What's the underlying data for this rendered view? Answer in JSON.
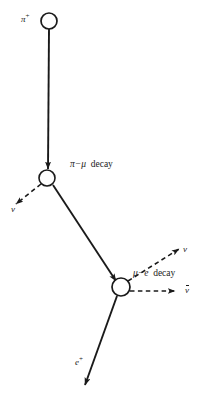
{
  "figure": {
    "background_color": "#ffffff",
    "stroke_color": "#1a1a1a",
    "width": 203,
    "height": 395
  },
  "labels": {
    "pi_plus": "π",
    "pi_plus_charge": "+",
    "neutrino_from_pion": "ν",
    "pi_mu_decay_left": "π−μ",
    "pi_mu_decay_word": "decay",
    "neutrino_from_muon": "ν",
    "mu_e_decay_left": "μ−e",
    "mu_e_decay_word": "decay",
    "antineutrino": "ν",
    "antineutrino_bar": "overbar",
    "positron": "e",
    "positron_charge": "+"
  },
  "vertices": [
    {
      "name": "pion-origin",
      "x": 49,
      "y": 21,
      "radius": 8,
      "style": "open-circle"
    },
    {
      "name": "pi-mu-vertex",
      "x": 47,
      "y": 178,
      "radius": 8,
      "style": "open-circle"
    },
    {
      "name": "mu-e-vertex",
      "x": 121,
      "y": 287,
      "radius": 9,
      "style": "open-circle"
    }
  ],
  "tracks": [
    {
      "name": "pion-track",
      "particle": "π+",
      "style": "solid",
      "arrow": true,
      "from": {
        "x": 49,
        "y": 29
      },
      "to": {
        "x": 48,
        "y": 168
      }
    },
    {
      "name": "neutrino-track-1",
      "particle": "ν",
      "style": "dashed",
      "arrow": true,
      "from": {
        "x": 41,
        "y": 184
      },
      "to": {
        "x": 15,
        "y": 205
      }
    },
    {
      "name": "muon-track",
      "particle": "μ+",
      "style": "solid",
      "arrow": true,
      "from": {
        "x": 53,
        "y": 185
      },
      "to": {
        "x": 115,
        "y": 280
      }
    },
    {
      "name": "neutrino-track-2",
      "particle": "ν",
      "style": "dashed",
      "arrow": true,
      "from": {
        "x": 128,
        "y": 281
      },
      "to": {
        "x": 178,
        "y": 248
      }
    },
    {
      "name": "antineutrino-track",
      "particle": "ν̄",
      "style": "dashed",
      "arrow": true,
      "from": {
        "x": 130,
        "y": 291
      },
      "to": {
        "x": 174,
        "y": 291
      }
    },
    {
      "name": "positron-track",
      "particle": "e+",
      "style": "solid",
      "arrow": true,
      "from": {
        "x": 117,
        "y": 296
      },
      "to": {
        "x": 84,
        "y": 386
      }
    }
  ]
}
